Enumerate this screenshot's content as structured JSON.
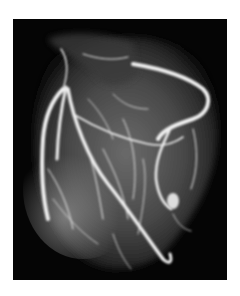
{
  "image": {
    "alt": "Coronary angiogram of a heart showing bright white blood vessels against a black background",
    "subject": "heart coronary arteries",
    "colors": {
      "background": "#ffffff",
      "panel": "#050505",
      "vessel": "#f2f2f2",
      "tissue": "#5a5a5a"
    }
  }
}
